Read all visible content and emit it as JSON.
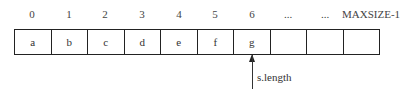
{
  "indices": [
    "0",
    "1",
    "2",
    "3",
    "4",
    "5",
    "6",
    "...",
    "...",
    "MAXSIZE-1"
  ],
  "cells": [
    "a",
    "b",
    "c",
    "d",
    "e",
    "f",
    "g",
    "",
    "",
    ""
  ],
  "pointer": {
    "label": "s.length",
    "target_index": 6
  }
}
